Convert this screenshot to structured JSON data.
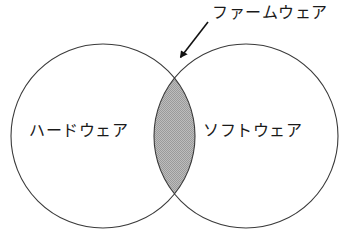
{
  "diagram": {
    "type": "venn-diagram",
    "title": "",
    "background_color": "#ffffff",
    "stroke_color": "#3a3a3a",
    "intersection_fill": "#b0b0b0",
    "text_color": "#1a1a1a",
    "sets": [
      {
        "id": "hardware",
        "label": "ハードウェア",
        "center_x": 103,
        "center_y": 136,
        "radius": 92,
        "fill": "#ffffff"
      },
      {
        "id": "software",
        "label": "ソフトウェア",
        "center_x": 246,
        "center_y": 136,
        "radius": 92,
        "fill": "#ffffff"
      }
    ],
    "intersection": {
      "id": "firmware",
      "label": "ファームウェア",
      "fill": "#b0b0b0",
      "left_x": 155,
      "right_x": 195,
      "top_y": 79,
      "bottom_y": 194
    },
    "annotation": {
      "id": "firmware-callout",
      "label": "ファームウェア",
      "arrow": {
        "start_x": 208,
        "start_y": 22,
        "end_x": 177,
        "end_y": 62,
        "head": "solid-triangle"
      }
    }
  }
}
